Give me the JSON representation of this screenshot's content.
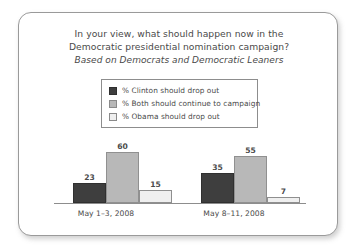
{
  "card": {
    "title_line_1": "In your view, what should happen now in the",
    "title_line_2": "Democratic presidential nomination campaign?",
    "subtitle": "Based on Democrats and Democratic Leaners"
  },
  "legend": {
    "items": [
      {
        "label": "% Clinton should drop out",
        "color": "#3e3e3e"
      },
      {
        "label": "% Both should continue to campaign",
        "color": "#b8b8b8"
      },
      {
        "label": "% Obama should drop out",
        "color": "#efefef"
      }
    ]
  },
  "chart_data": {
    "type": "bar",
    "title": "In your view, what should happen now in the Democratic presidential nomination campaign?",
    "subtitle": "Based on Democrats and Democratic Leaners",
    "xlabel": "",
    "ylabel": "",
    "ylim": [
      0,
      60
    ],
    "grid": false,
    "legend_position": "top-center",
    "categories": [
      "May 1–3, 2008",
      "May 8–11, 2008"
    ],
    "series": [
      {
        "name": "% Clinton should drop out",
        "color": "#3e3e3e",
        "values": [
          23,
          35
        ]
      },
      {
        "name": "% Both should continue to campaign",
        "color": "#b8b8b8",
        "values": [
          60,
          55
        ]
      },
      {
        "name": "% Obama should drop out",
        "color": "#efefef",
        "values": [
          15,
          7
        ]
      }
    ],
    "groups": [
      {
        "category": "May 1–3, 2008",
        "bars": [
          {
            "series": "% Clinton should drop out",
            "value": 23,
            "label": "23",
            "style": "bar-dark"
          },
          {
            "series": "% Both should continue to campaign",
            "value": 60,
            "label": "60",
            "style": "bar-mid"
          },
          {
            "series": "% Obama should drop out",
            "value": 15,
            "label": "15",
            "style": "bar-light"
          }
        ]
      },
      {
        "category": "May 8–11, 2008",
        "bars": [
          {
            "series": "% Clinton should drop out",
            "value": 35,
            "label": "35",
            "style": "bar-dark"
          },
          {
            "series": "% Both should continue to campaign",
            "value": 55,
            "label": "55",
            "style": "bar-mid"
          },
          {
            "series": "% Obama should drop out",
            "value": 7,
            "label": "7",
            "style": "bar-light"
          }
        ]
      }
    ]
  }
}
